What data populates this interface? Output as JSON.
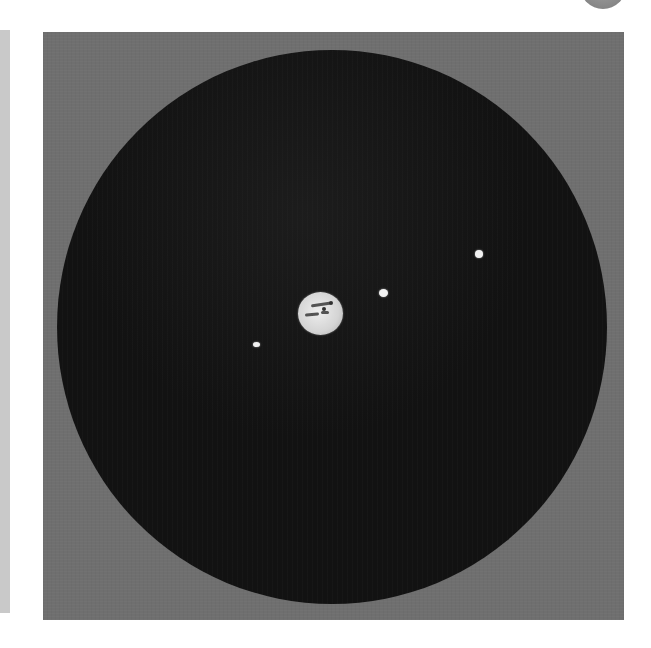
{
  "figure": {
    "colors": {
      "plate_background": "#6f6f6f",
      "field_of_view": "#121212",
      "planet": "#d9d9d9",
      "moons": "#f2f2f2",
      "page_edge_strip": "#c9c9c9"
    },
    "planet": {
      "name": "planet",
      "center": [
        320,
        313
      ],
      "diameter_px": 44
    },
    "moons": [
      {
        "id": "moon-1",
        "center": [
          383,
          293
        ],
        "diameter_px": 8
      },
      {
        "id": "moon-2",
        "center": [
          479,
          254
        ],
        "diameter_px": 8
      },
      {
        "id": "moon-3",
        "center": [
          256,
          344
        ],
        "diameter_px": 6
      }
    ],
    "field_of_view": {
      "center": [
        331,
        327
      ],
      "diameter_px": 552
    }
  },
  "page": {
    "bleed_through_text": ""
  }
}
